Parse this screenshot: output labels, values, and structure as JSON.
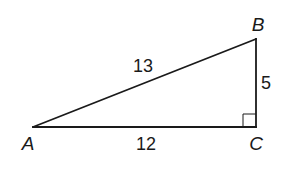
{
  "diagram": {
    "type": "right-triangle",
    "vertices": [
      {
        "name": "A",
        "x": 33,
        "y": 127,
        "label_x": 28,
        "label_y": 150
      },
      {
        "name": "B",
        "x": 256,
        "y": 39,
        "label_x": 258,
        "label_y": 31
      },
      {
        "name": "C",
        "x": 256,
        "y": 127,
        "label_x": 256,
        "label_y": 150
      }
    ],
    "sides": [
      {
        "name": "AB",
        "length": "13",
        "label_x": 143,
        "label_y": 72
      },
      {
        "name": "BC",
        "length": "5",
        "label_x": 266,
        "label_y": 89
      },
      {
        "name": "AC",
        "length": "12",
        "label_x": 146,
        "label_y": 150
      }
    ],
    "right_angle_at": "C",
    "right_angle_marker_size": 13,
    "stroke_color": "#1a1a1a",
    "background_color": "#ffffff"
  }
}
